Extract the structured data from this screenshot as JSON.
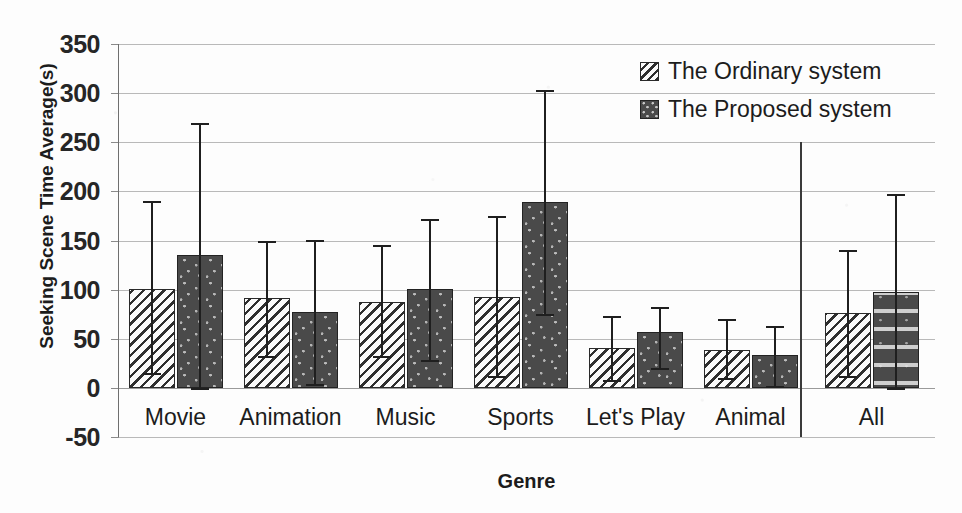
{
  "chart_data": {
    "type": "bar",
    "title": "",
    "xlabel": "Genre",
    "ylabel": "Seeking Scene Time Average(s)",
    "ylim": [
      -50,
      350
    ],
    "ytick_values": [
      350,
      300,
      250,
      200,
      150,
      100,
      50,
      0,
      -50
    ],
    "ytick_labels": [
      "350",
      "300",
      "250",
      "200",
      "150",
      "100",
      "50",
      "0",
      "-50"
    ],
    "grid": true,
    "legend_position": "top-right",
    "categories": [
      "Movie",
      "Animation",
      "Music",
      "Sports",
      "Let's Play",
      "Animal",
      "All"
    ],
    "series": [
      {
        "name": "The Ordinary system",
        "pattern": "diagonal-hatch",
        "values": [
          101,
          91,
          87,
          92,
          41,
          39,
          76
        ],
        "error_upper": [
          190,
          150,
          145,
          175,
          73,
          70,
          140
        ],
        "error_lower": [
          15,
          32,
          32,
          12,
          8,
          10,
          12
        ]
      },
      {
        "name": "The Proposed system",
        "pattern": "dark-dotted",
        "values": [
          135,
          77,
          101,
          189,
          57,
          33,
          98
        ],
        "error_upper": [
          270,
          151,
          172,
          303,
          82,
          63,
          197
        ],
        "error_lower": [
          0,
          4,
          28,
          75,
          20,
          2,
          0
        ]
      }
    ],
    "annotations": [
      {
        "name": "group-separator",
        "description": "vertical rule separating Animal from All"
      }
    ]
  },
  "legend": {
    "items": [
      {
        "label": "The Ordinary system",
        "swatch": "hatch-swatch"
      },
      {
        "label": "The Proposed system",
        "swatch": "dotted-swatch"
      }
    ]
  }
}
